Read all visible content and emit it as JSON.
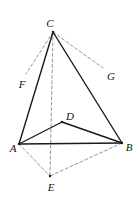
{
  "figure": {
    "width": 139,
    "height": 201,
    "background_color": "#ffffff",
    "solid_line_color": "#1a1a1a",
    "dashed_line_color": "#8a8a8a",
    "solid_line_width": 1.4,
    "dashed_line_width": 0.9,
    "dash_pattern": "3,2.4"
  },
  "chart_data": {
    "type": "diagram",
    "points": [
      {
        "name": "A",
        "x": 19,
        "y": 144,
        "label": "A",
        "label_x": 13,
        "label_y": 148,
        "marked": true
      },
      {
        "name": "B",
        "x": 122,
        "y": 143,
        "label": "B",
        "label_x": 129,
        "label_y": 147,
        "marked": true
      },
      {
        "name": "C",
        "x": 53,
        "y": 32,
        "label": "C",
        "label_x": 50,
        "label_y": 23,
        "marked": true
      },
      {
        "name": "D",
        "x": 62,
        "y": 122,
        "label": "D",
        "label_x": 70,
        "label_y": 116,
        "marked": true
      },
      {
        "name": "E",
        "x": 50,
        "y": 176,
        "label": "E",
        "label_x": 51,
        "label_y": 187,
        "marked": true
      },
      {
        "name": "F",
        "x": 26,
        "y": 74,
        "label": "F",
        "label_x": 22,
        "label_y": 84,
        "marked": false
      },
      {
        "name": "G",
        "x": 103,
        "y": 68,
        "label": "G",
        "label_x": 111,
        "label_y": 76,
        "marked": false
      }
    ],
    "segments": [
      {
        "from": "A",
        "to": "B",
        "style": "solid"
      },
      {
        "from": "A",
        "to": "C",
        "style": "solid"
      },
      {
        "from": "B",
        "to": "C",
        "style": "solid"
      },
      {
        "from": "A",
        "to": "D",
        "style": "solid"
      },
      {
        "from": "B",
        "to": "D",
        "style": "solid"
      },
      {
        "from": "C",
        "to": "E",
        "style": "dashed"
      },
      {
        "from": "A",
        "to": "E",
        "style": "dashed"
      },
      {
        "from": "B",
        "to": "E",
        "style": "dashed"
      },
      {
        "from": "C",
        "to": "F",
        "style": "dashed"
      },
      {
        "from": "C",
        "to": "G",
        "style": "dashed"
      }
    ],
    "labels": [
      "A",
      "B",
      "C",
      "D",
      "E",
      "F",
      "G"
    ],
    "xlabel": "",
    "ylabel": "",
    "legend": []
  }
}
